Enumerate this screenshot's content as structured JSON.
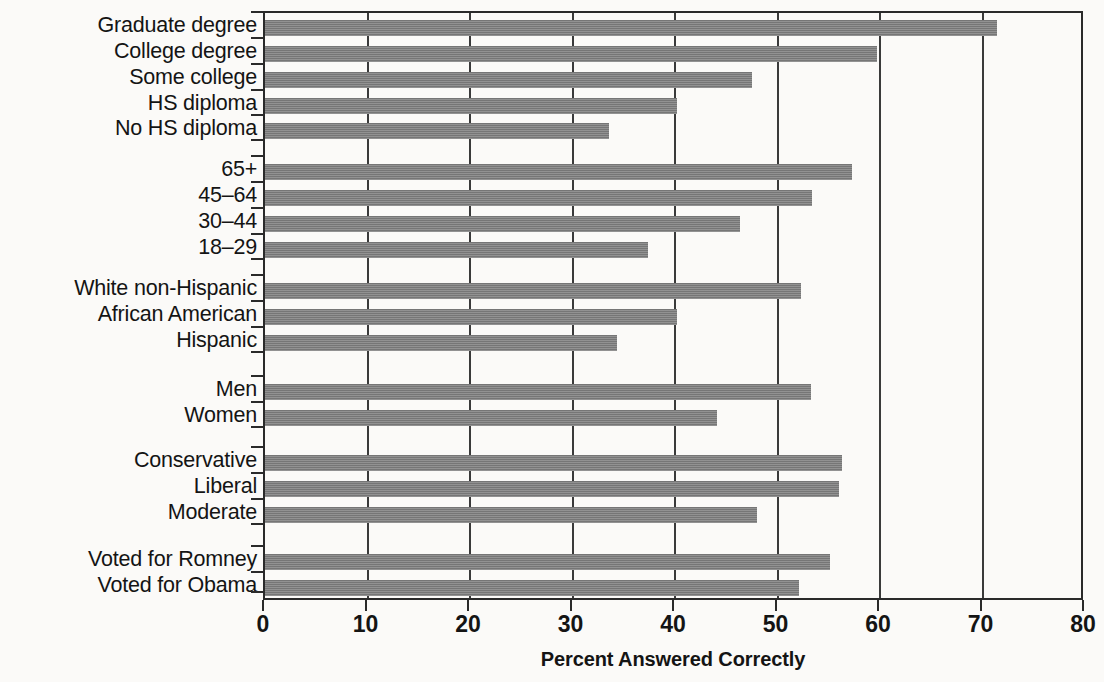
{
  "chart_data": {
    "type": "bar",
    "orientation": "horizontal",
    "title": "",
    "xlabel": "Percent Answered Correctly",
    "ylabel": "",
    "xlim": [
      0,
      80
    ],
    "xticks": [
      0,
      10,
      20,
      30,
      40,
      50,
      60,
      70,
      80
    ],
    "xtick_labels": [
      "0",
      "10",
      "20",
      "30",
      "40",
      "50",
      "60",
      "70",
      "80"
    ],
    "grid": true,
    "grid_axis": "x",
    "legend": false,
    "bar_color": "#7d7d7d",
    "groups": [
      {
        "name": "Education",
        "categories": [
          "Graduate degree",
          "College degree",
          "Some college",
          "HS diploma",
          "No HS diploma"
        ],
        "values": [
          71.4,
          59.7,
          47.5,
          40.2,
          33.6
        ]
      },
      {
        "name": "Age",
        "categories": [
          "65+",
          "45–64",
          "30–44",
          "18–29"
        ],
        "values": [
          57.3,
          53.4,
          46.3,
          37.4
        ]
      },
      {
        "name": "Race and ethnicity",
        "categories": [
          "White non-Hispanic",
          "African American",
          "Hispanic"
        ],
        "values": [
          52.3,
          40.2,
          34.3
        ]
      },
      {
        "name": "Gender",
        "categories": [
          "Men",
          "Women"
        ],
        "values": [
          53.3,
          44.1
        ]
      },
      {
        "name": "Ideology",
        "categories": [
          "Conservative",
          "Liberal",
          "Moderate"
        ],
        "values": [
          56.3,
          56.0,
          48.0
        ]
      },
      {
        "name": "Vote",
        "categories": [
          "Voted for Romney",
          "Voted for Obama"
        ],
        "values": [
          55.1,
          52.1
        ]
      }
    ],
    "categories": [
      "Graduate degree",
      "College degree",
      "Some college",
      "HS diploma",
      "No HS diploma",
      "65+",
      "45–64",
      "30–44",
      "18–29",
      "White non-Hispanic",
      "African American",
      "Hispanic",
      "Men",
      "Women",
      "Conservative",
      "Liberal",
      "Moderate",
      "Voted for Romney",
      "Voted for Obama"
    ],
    "values": [
      71.4,
      59.7,
      47.5,
      40.2,
      33.6,
      57.3,
      53.4,
      46.3,
      37.4,
      52.3,
      40.2,
      34.3,
      53.3,
      44.1,
      56.3,
      56.0,
      48.0,
      55.1,
      52.1
    ]
  },
  "layout": {
    "plot_left_px": 263,
    "plot_top_px": 11,
    "plot_width_px": 820,
    "plot_height_px": 589,
    "px_per_unit": 10.25,
    "bar_height_px": 16,
    "rows": [
      {
        "label": "Graduate degree",
        "value": 71.4,
        "y": 18
      },
      {
        "label": "College degree",
        "value": 59.7,
        "y": 44
      },
      {
        "label": "Some college",
        "value": 47.5,
        "y": 70
      },
      {
        "label": "HS diploma",
        "value": 40.2,
        "y": 96
      },
      {
        "label": "No HS diploma",
        "value": 33.6,
        "y": 121
      },
      {
        "label": "65+",
        "value": 57.3,
        "y": 162
      },
      {
        "label": "45–64",
        "value": 53.4,
        "y": 188
      },
      {
        "label": "30–44",
        "value": 46.3,
        "y": 214
      },
      {
        "label": "18–29",
        "value": 37.4,
        "y": 240
      },
      {
        "label": "White non-Hispanic",
        "value": 52.3,
        "y": 281
      },
      {
        "label": "African American",
        "value": 40.2,
        "y": 307
      },
      {
        "label": "Hispanic",
        "value": 34.3,
        "y": 333
      },
      {
        "label": "Men",
        "value": 53.3,
        "y": 382
      },
      {
        "label": "Women",
        "value": 44.1,
        "y": 408
      },
      {
        "label": "Conservative",
        "value": 56.3,
        "y": 453
      },
      {
        "label": "Liberal",
        "value": 56.0,
        "y": 479
      },
      {
        "label": "Moderate",
        "value": 48.0,
        "y": 505
      },
      {
        "label": "Voted for Romney",
        "value": 55.1,
        "y": 552
      },
      {
        "label": "Voted for Obama",
        "value": 52.1,
        "y": 578
      }
    ]
  }
}
